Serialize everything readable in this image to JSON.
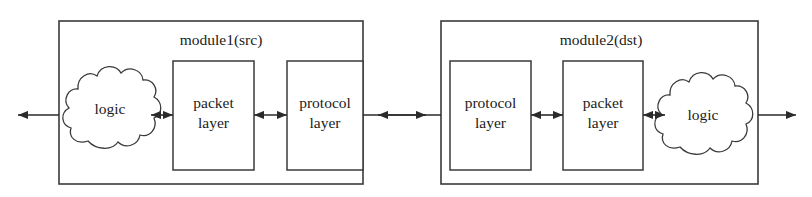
{
  "diagram": {
    "type": "block-diagram",
    "title_visible": false,
    "background_color": "#ffffff",
    "line_color": "#3a3a3a",
    "text_color": "#1c1c1c",
    "modules": [
      {
        "id": "module1",
        "title": "module1(src)",
        "cloud_label": "logic",
        "blocks": [
          {
            "id": "m1-packet",
            "line1": "packet",
            "line2": "layer"
          },
          {
            "id": "m1-protocol",
            "line1": "protocol",
            "line2": "layer"
          }
        ]
      },
      {
        "id": "module2",
        "title": "module2(dst)",
        "cloud_label": "logic",
        "blocks": [
          {
            "id": "m2-protocol",
            "line1": "protocol",
            "line2": "layer"
          },
          {
            "id": "m2-packet",
            "line1": "packet",
            "line2": "layer"
          }
        ]
      }
    ],
    "connectors": [
      {
        "id": "external-left",
        "style": "single-arrow",
        "direction": "left"
      },
      {
        "id": "m1-logic-to-packet",
        "style": "double-arrow",
        "direction": "both"
      },
      {
        "id": "m1-packet-to-protocol",
        "style": "double-arrow",
        "direction": "both"
      },
      {
        "id": "module1-to-module2",
        "style": "double-arrow",
        "direction": "both"
      },
      {
        "id": "m2-protocol-to-packet",
        "style": "double-arrow",
        "direction": "both"
      },
      {
        "id": "m2-packet-to-logic",
        "style": "double-arrow",
        "direction": "both"
      },
      {
        "id": "external-right",
        "style": "single-arrow",
        "direction": "right"
      }
    ]
  }
}
